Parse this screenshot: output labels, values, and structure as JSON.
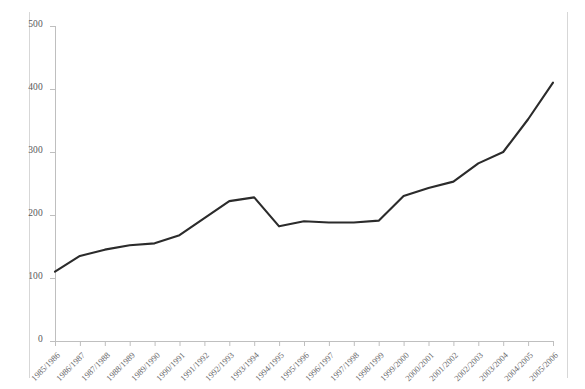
{
  "chart_data": {
    "type": "line",
    "title": "",
    "subtitle": "",
    "xlabel": "",
    "ylabel": "",
    "ylim": [
      0,
      500
    ],
    "ytick_values": [
      0,
      100,
      200,
      300,
      400,
      500
    ],
    "ytick_labels": [
      "0",
      "100",
      "200",
      "300",
      "400",
      "500"
    ],
    "grid": false,
    "legend": false,
    "legend_position": "none",
    "line_color": "#2b2b2b",
    "axis_color": "#bfbfbf",
    "categories": [
      "1985/1986",
      "1986/1987",
      "1987/1988",
      "1988/1989",
      "1989/1990",
      "1990/1991",
      "1991/1992",
      "1992/1993",
      "1993/1994",
      "1994/1995",
      "1995/1996",
      "1996/1997",
      "1997/1998",
      "1998/1999",
      "1999/2000",
      "2000/2001",
      "2001/2002",
      "2002/2003",
      "2003/2004",
      "2004/2005",
      "2005/2006"
    ],
    "values": [
      110,
      135,
      145,
      152,
      155,
      168,
      195,
      222,
      228,
      182,
      190,
      188,
      188,
      191,
      230,
      243,
      253,
      282,
      300,
      352,
      410
    ],
    "series": [
      {
        "name": "series-1",
        "values": [
          110,
          135,
          145,
          152,
          155,
          168,
          195,
          222,
          228,
          182,
          190,
          188,
          188,
          191,
          230,
          243,
          253,
          282,
          300,
          352,
          410
        ]
      }
    ]
  }
}
